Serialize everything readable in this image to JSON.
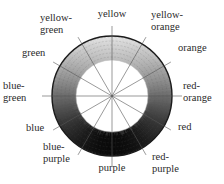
{
  "diagram": {
    "type": "color-wheel",
    "center": [
      112,
      96
    ],
    "outer_radius": 60,
    "inner_radius": 36,
    "ink_color": "#1a1a1a",
    "labels": [
      {
        "id": "yellow",
        "lines": [
          "yellow"
        ],
        "angle": 0,
        "x": 112,
        "y": 17,
        "anchor": "middle"
      },
      {
        "id": "yellow-orange",
        "lines": [
          "yellow-",
          "orange"
        ],
        "angle": 30,
        "x": 151,
        "y": 18,
        "anchor": "start"
      },
      {
        "id": "orange",
        "lines": [
          "orange"
        ],
        "angle": 60,
        "x": 178,
        "y": 51,
        "anchor": "start"
      },
      {
        "id": "red-orange",
        "lines": [
          "red-",
          "orange"
        ],
        "angle": 90,
        "x": 183,
        "y": 89,
        "anchor": "start"
      },
      {
        "id": "red",
        "lines": [
          "red"
        ],
        "angle": 120,
        "x": 178,
        "y": 130,
        "anchor": "start"
      },
      {
        "id": "red-purple",
        "lines": [
          "red-",
          "purple"
        ],
        "angle": 150,
        "x": 152,
        "y": 160,
        "anchor": "start"
      },
      {
        "id": "purple",
        "lines": [
          "purple"
        ],
        "angle": 180,
        "x": 112,
        "y": 171,
        "anchor": "middle"
      },
      {
        "id": "blue-purple",
        "lines": [
          "blue-",
          "purple"
        ],
        "angle": 210,
        "x": 43,
        "y": 150,
        "anchor": "start"
      },
      {
        "id": "blue",
        "lines": [
          "blue"
        ],
        "angle": 240,
        "x": 26,
        "y": 131,
        "anchor": "start"
      },
      {
        "id": "blue-green",
        "lines": [
          "blue-",
          "green"
        ],
        "angle": 270,
        "x": 3,
        "y": 89,
        "anchor": "start"
      },
      {
        "id": "green",
        "lines": [
          "green"
        ],
        "angle": 300,
        "x": 22,
        "y": 56,
        "anchor": "start"
      },
      {
        "id": "yellow-green",
        "lines": [
          "yellow-",
          "green"
        ],
        "angle": 330,
        "x": 40,
        "y": 21,
        "anchor": "start"
      }
    ]
  }
}
